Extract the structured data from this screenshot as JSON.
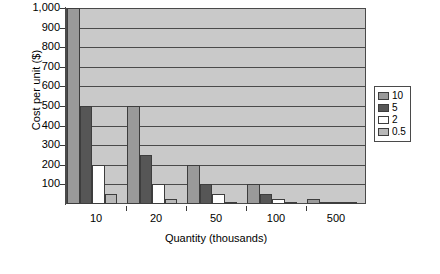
{
  "chart_data": {
    "type": "bar",
    "title": "",
    "xlabel": "Quantity (thousands)",
    "ylabel": "Cost per unit ($)",
    "categories": [
      "10",
      "20",
      "50",
      "100",
      "500"
    ],
    "ylim": [
      0,
      1000
    ],
    "ytick_labels": [
      "1,000",
      "900",
      "800",
      "700",
      "600",
      "500",
      "400",
      "300",
      "200",
      "100"
    ],
    "ytick_values": [
      1000,
      900,
      800,
      700,
      600,
      500,
      400,
      300,
      200,
      100
    ],
    "grid": "horizontal",
    "legend_position": "right",
    "legend_title": "",
    "series": [
      {
        "name": "10",
        "color": "#9a9a9a",
        "values": [
          1000,
          500,
          200,
          100,
          25
        ]
      },
      {
        "name": "5",
        "color": "#565656",
        "values": [
          500,
          250,
          100,
          50,
          12
        ]
      },
      {
        "name": "2",
        "color": "#ffffff",
        "values": [
          200,
          100,
          50,
          25,
          6
        ]
      },
      {
        "name": "0.5",
        "color": "#b8b8b8",
        "values": [
          50,
          25,
          12,
          8,
          3
        ]
      }
    ]
  },
  "legend": {
    "items": [
      {
        "label": "10"
      },
      {
        "label": "5"
      },
      {
        "label": "2"
      },
      {
        "label": "0.5"
      }
    ]
  }
}
